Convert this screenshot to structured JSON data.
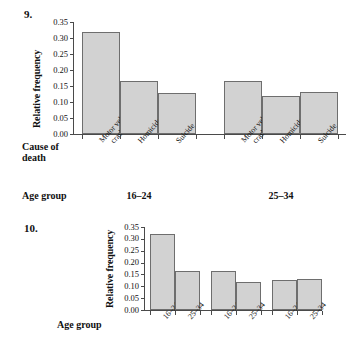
{
  "problems": {
    "nine": "9.",
    "ten": "10."
  },
  "chart_data": [
    {
      "type": "bar",
      "id": "chart-9",
      "title": "",
      "xlabel": "Cause of death",
      "xlabel_lines": [
        "Cause of",
        "death"
      ],
      "ylabel": "Relative frequency",
      "ylim": [
        0.0,
        0.35
      ],
      "yticks": [
        "0.00",
        "0.05",
        "0.10",
        "0.15",
        "0.20",
        "0.25",
        "0.30",
        "0.35"
      ],
      "ytick_values": [
        0.0,
        0.05,
        0.1,
        0.15,
        0.2,
        0.25,
        0.3,
        0.35
      ],
      "grid": false,
      "legend": "none",
      "group_axis_label": "Age group",
      "groups": [
        {
          "name": "16–24",
          "categories": [
            "Motor vehicle crashes",
            "Homicide",
            "Suicide"
          ],
          "category_lines": [
            [
              "Motor vehicle",
              "crashes"
            ],
            [
              "Homicide"
            ],
            [
              "Suicide"
            ]
          ],
          "values": [
            0.32,
            0.165,
            0.127
          ]
        },
        {
          "name": "25–34",
          "categories": [
            "Motor vehicle crashes",
            "Homicide",
            "Suicide"
          ],
          "category_lines": [
            [
              "Motor vehicle",
              "crashes"
            ],
            [
              "Homicide"
            ],
            [
              "Suicide"
            ]
          ],
          "values": [
            0.167,
            0.119,
            0.131
          ]
        }
      ],
      "bar_color": "#d2d2d2",
      "bar_edge_color": "#6e6e6e"
    },
    {
      "type": "bar",
      "id": "chart-10",
      "title": "",
      "xlabel": "Age group",
      "ylabel": "Relative frequency",
      "ylim": [
        0.0,
        0.35
      ],
      "yticks": [
        "0.00",
        "0.05",
        "0.10",
        "0.15",
        "0.20",
        "0.25",
        "0.30",
        "0.35"
      ],
      "ytick_values": [
        0.0,
        0.05,
        0.1,
        0.15,
        0.2,
        0.25,
        0.3,
        0.35
      ],
      "grid": false,
      "legend": "none",
      "groups": [
        {
          "name": "Motor vehicle crashes",
          "categories": [
            "16–24",
            "25–34"
          ],
          "values": [
            0.32,
            0.165
          ]
        },
        {
          "name": "Homicide",
          "categories": [
            "16–24",
            "25–34"
          ],
          "values": [
            0.166,
            0.118
          ]
        },
        {
          "name": "Suicide",
          "categories": [
            "16–24",
            "25–34"
          ],
          "values": [
            0.127,
            0.13
          ]
        }
      ],
      "bar_color": "#d2d2d2",
      "bar_edge_color": "#6e6e6e"
    }
  ]
}
